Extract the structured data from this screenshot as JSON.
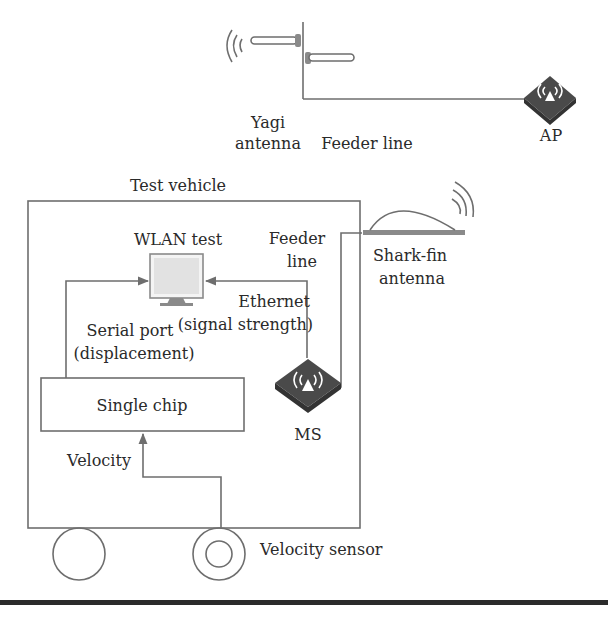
{
  "diagram": {
    "type": "system-setup",
    "ground_station": {
      "yagi_antenna": {
        "label_line1": "Yagi",
        "label_line2": "antenna"
      },
      "feeder_line": {
        "label": "Feeder line"
      },
      "ap": {
        "label": "AP"
      }
    },
    "test_vehicle": {
      "label": "Test vehicle",
      "wlan_test": {
        "label": "WLAN test"
      },
      "feeder_line": {
        "label_line1": "Feeder",
        "label_line2": "line"
      },
      "shark_fin_antenna": {
        "label_line1": "Shark-fin",
        "label_line2": "antenna"
      },
      "ethernet_link": {
        "label_line1": "Ethernet",
        "label_line2": "(signal strength)"
      },
      "serial_port_link": {
        "label_line1": "Serial port",
        "label_line2": "(displacement)"
      },
      "single_chip": {
        "label": "Single chip"
      },
      "ms": {
        "label": "MS"
      },
      "velocity_link": {
        "label": "Velocity"
      },
      "velocity_sensor": {
        "label": "Velocity sensor"
      }
    },
    "colors": {
      "line": "#6e6e6e",
      "icon_fill": "#4a4a4a",
      "monitor_screen": "#e6e6e6",
      "text": "#2a2a2a",
      "ground_bar": "#2b2b2b"
    }
  }
}
